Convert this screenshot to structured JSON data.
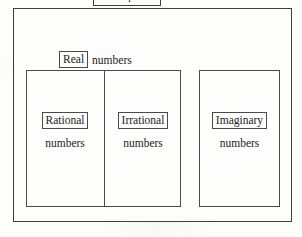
{
  "diagram": {
    "background_color": "#fdfdfc",
    "line_color": "#4a4a4a",
    "text_color": "#1c1c1c",
    "sets": {
      "complex": {
        "boxed_term": "Complex",
        "plain_word": "numbers",
        "note": "cut off at top edge of image"
      },
      "real": {
        "boxed_term": "Real",
        "plain_word": "numbers"
      },
      "rational": {
        "boxed_term": "Rational",
        "sub_word": "numbers"
      },
      "irrational": {
        "boxed_term": "Irrational",
        "sub_word": "numbers"
      },
      "imaginary": {
        "boxed_term": "Imaginary",
        "sub_word": "numbers"
      }
    }
  }
}
